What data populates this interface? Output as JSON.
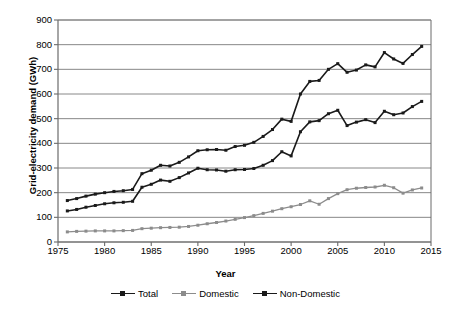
{
  "chart_data": {
    "type": "line",
    "title": "",
    "xlabel": "Year",
    "ylabel": "Grid-electricity demand (GWh)",
    "xlim": [
      1975,
      2015
    ],
    "ylim": [
      0,
      900
    ],
    "ytick_step": 100,
    "xtick_step": 5,
    "grid": "horizontal",
    "legend_position": "bottom",
    "yticks": [
      "900",
      "800",
      "700",
      "600",
      "500",
      "400",
      "300",
      "200",
      "100",
      "0"
    ],
    "xticks": [
      "1975",
      "1980",
      "1985",
      "1990",
      "1995",
      "2000",
      "2005",
      "2010",
      "2015"
    ],
    "x": [
      1976,
      1977,
      1978,
      1979,
      1980,
      1981,
      1982,
      1983,
      1984,
      1985,
      1986,
      1987,
      1988,
      1989,
      1990,
      1991,
      1992,
      1993,
      1994,
      1995,
      1996,
      1997,
      1998,
      1999,
      2000,
      2001,
      2002,
      2003,
      2004,
      2005,
      2006,
      2007,
      2008,
      2009,
      2010,
      2011,
      2012,
      2013,
      2014
    ],
    "series": [
      {
        "name": "Total",
        "color": "#1a1a1a",
        "values": [
          168,
          176,
          186,
          194,
          200,
          205,
          208,
          213,
          277,
          291,
          311,
          308,
          323,
          345,
          370,
          374,
          375,
          372,
          387,
          392,
          404,
          428,
          456,
          498,
          489,
          600,
          651,
          655,
          700,
          723,
          688,
          697,
          718,
          710,
          768,
          742,
          724,
          760,
          793
        ]
      },
      {
        "name": "Domestic",
        "color": "#8c8c8c",
        "values": [
          41,
          43,
          44,
          45,
          45,
          45,
          46,
          47,
          54,
          56,
          58,
          59,
          60,
          63,
          68,
          74,
          79,
          85,
          92,
          99,
          107,
          116,
          125,
          135,
          143,
          152,
          167,
          153,
          176,
          196,
          212,
          218,
          221,
          223,
          230,
          220,
          198,
          211,
          219
        ]
      },
      {
        "name": "Non-Domestic",
        "color": "#1a1a1a",
        "values": [
          126,
          132,
          141,
          148,
          155,
          159,
          161,
          165,
          222,
          234,
          251,
          246,
          261,
          280,
          299,
          293,
          292,
          287,
          293,
          294,
          298,
          311,
          330,
          366,
          349,
          447,
          487,
          492,
          520,
          534,
          472,
          486,
          496,
          484,
          530,
          516,
          523,
          549,
          570
        ]
      }
    ],
    "legend": [
      "Total",
      "Domestic",
      "Non-Domestic"
    ]
  },
  "colors": {
    "axis": "#6b6b6b",
    "grid": "#7a7a7a",
    "total": "#1a1a1a",
    "domestic": "#8c8c8c",
    "non_domestic": "#1a1a1a",
    "background": "#ffffff"
  }
}
